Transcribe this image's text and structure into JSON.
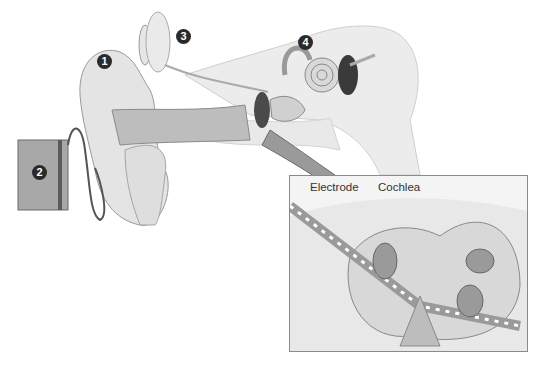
{
  "diagram": {
    "markers": [
      {
        "id": "1",
        "label": "1"
      },
      {
        "id": "2",
        "label": "2"
      },
      {
        "id": "3",
        "label": "3"
      },
      {
        "id": "4",
        "label": "4"
      }
    ],
    "inset": {
      "labels": {
        "electrode": "Electrode",
        "cochlea": "Cochlea"
      }
    },
    "colors": {
      "tissue": "#e6e6e6",
      "bone": "#ececec",
      "canal": "#bdbdbd",
      "dark": "#3a3a3a",
      "badge": "#2a2a2a"
    }
  }
}
